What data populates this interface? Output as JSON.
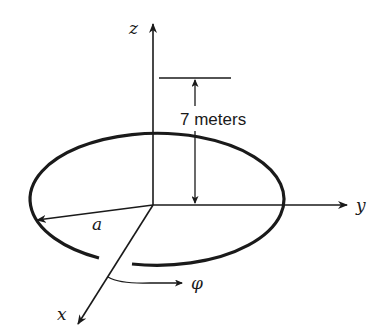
{
  "diagram": {
    "type": "3d-geometry",
    "axes": {
      "z": {
        "label": "z"
      },
      "y": {
        "label": "y"
      },
      "x": {
        "label": "x"
      }
    },
    "labels": {
      "radius": "a",
      "height": "7 meters",
      "angle": "φ"
    },
    "colors": {
      "stroke": "#1a1a1a",
      "background": "#ffffff"
    }
  }
}
